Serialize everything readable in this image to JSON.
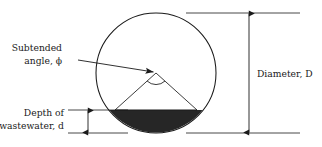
{
  "figure": {
    "name": "circular-pipe-cross-section",
    "background_color": "#ffffff",
    "line_color": "#1a1a1a",
    "fill_color": "#262626",
    "width": 322,
    "height": 147
  },
  "labels": {
    "subtended_angle": {
      "line1": "Subtended",
      "line2_prefix": "angle, ",
      "line2_symbol": "ϕ"
    },
    "depth": {
      "line1": "Depth of",
      "line2_prefix": "wastewater, ",
      "line2_symbol": "d"
    },
    "diameter": {
      "prefix": "Diameter, ",
      "symbol": "D"
    }
  },
  "geometry": {
    "circle": {
      "center_x": 156,
      "center_y": 73,
      "radius": 60
    },
    "water_surface_y": 110,
    "chord_left_x": 115,
    "chord_right_x": 197,
    "circle_top_y": 13,
    "circle_bottom_y": 133,
    "diameter_dimension_x": 249,
    "depth_dimension_x": 88,
    "leader_start_x": 78,
    "leader_start_y": 60,
    "angle_arc_radius": 13
  }
}
